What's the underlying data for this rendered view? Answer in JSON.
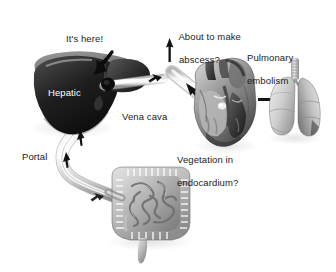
{
  "figure": {
    "background_color": "#ffffff",
    "text_color": "#1a1a1a",
    "organ_label_color": "#ffffff"
  },
  "labels": {
    "its_here": "It's here!",
    "hepatic": "Hepatic",
    "portal": "Portal",
    "vena_cava": "Vena cava",
    "about_to_make_abscess_line1": "About to make",
    "about_to_make_abscess_line2": "abscess?",
    "vegetation_line1": "Vegetation in",
    "vegetation_line2": "endocardium?",
    "pulmonary_line1": "Pulmonary",
    "pulmonary_line2": "embolism"
  },
  "organs": [
    {
      "name": "liver",
      "label": "Hepatic"
    },
    {
      "name": "portal-vein",
      "label": "Portal"
    },
    {
      "name": "intestine",
      "label": ""
    },
    {
      "name": "vena-cava",
      "label": "Vena cava"
    },
    {
      "name": "heart",
      "label": ""
    },
    {
      "name": "lungs",
      "label": ""
    }
  ],
  "arrows": [
    {
      "name": "its-here-arrow",
      "points_to": "liver"
    },
    {
      "name": "portal-flow-arrow-upper",
      "points_to": "liver"
    },
    {
      "name": "portal-flow-arrow-lower",
      "points_to": "portal-vein"
    },
    {
      "name": "portal-flow-arrow-gut",
      "points_to": "portal-vein"
    },
    {
      "name": "hepatic-vein-flow-arrow",
      "points_to": "vena-cava"
    },
    {
      "name": "vena-cava-up-arrow",
      "points_to": "heart"
    },
    {
      "name": "heart-to-lung-arrow",
      "points_to": "lungs"
    }
  ]
}
